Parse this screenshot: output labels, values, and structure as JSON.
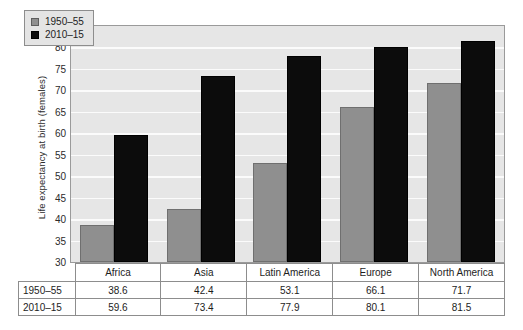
{
  "chart_data": {
    "type": "bar",
    "title": "",
    "xlabel": "",
    "ylabel": "Life expectancy at birth (females)",
    "ylim": [
      30,
      85
    ],
    "yticks": [
      30,
      35,
      40,
      45,
      50,
      55,
      60,
      65,
      70,
      75,
      80,
      85
    ],
    "grid": true,
    "legend_position": "top-left",
    "categories": [
      "Africa",
      "Asia",
      "Latin America",
      "Europe",
      "North America"
    ],
    "series": [
      {
        "name": "1950–55",
        "color": "#8f8f8f",
        "values": [
          38.6,
          42.4,
          53.1,
          66.1,
          71.7
        ]
      },
      {
        "name": "2010–15",
        "color": "#0c0c0c",
        "values": [
          59.6,
          73.4,
          77.9,
          80.1,
          81.5
        ]
      }
    ]
  },
  "legend": {
    "items": [
      {
        "label": "1950–55",
        "swatch": "old"
      },
      {
        "label": "2010–15",
        "swatch": "new"
      }
    ]
  },
  "table": {
    "corner": "",
    "columns": [
      "Africa",
      "Asia",
      "Latin America",
      "Europe",
      "North America"
    ],
    "rows": [
      {
        "label": "1950–55",
        "values": [
          "38.6",
          "42.4",
          "53.1",
          "66.1",
          "71.7"
        ]
      },
      {
        "label": "2010–15",
        "values": [
          "59.6",
          "73.4",
          "77.9",
          "80.1",
          "81.5"
        ]
      }
    ]
  }
}
